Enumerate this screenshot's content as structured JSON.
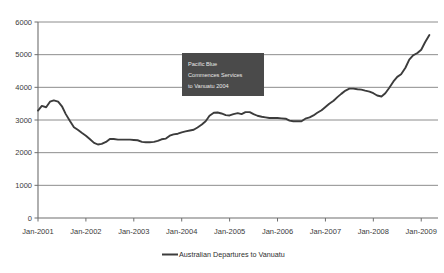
{
  "chart_data": {
    "type": "line",
    "title": "",
    "xlabel": "",
    "ylabel": "",
    "ylim": [
      0,
      6000
    ],
    "ytick_labels": [
      "0",
      "1000",
      "2000",
      "3000",
      "4000",
      "5000",
      "6000"
    ],
    "ytick_values": [
      0,
      1000,
      2000,
      3000,
      4000,
      5000,
      6000
    ],
    "xtick_labels": [
      "Jan-2001",
      "Jan-2002",
      "Jan-2003",
      "Jan-2004",
      "Jan-2005",
      "Jan-2006",
      "Jan-2007",
      "Jan-2008",
      "Jan-2009"
    ],
    "xtick_values": [
      2001,
      2002,
      2003,
      2004,
      2005,
      2006,
      2007,
      2008,
      2009
    ],
    "xlim": [
      2001,
      2009.35
    ],
    "grid": "horizontal",
    "legend_position": "bottom",
    "legend": [
      "Australian Departures to Vanuatu"
    ],
    "series": [
      {
        "name": "Australian Departures to Vanuatu",
        "color": "#3c3c3c",
        "x": [
          2001.0,
          2001.08,
          2001.17,
          2001.25,
          2001.33,
          2001.42,
          2001.5,
          2001.58,
          2001.67,
          2001.75,
          2001.83,
          2001.92,
          2002.0,
          2002.08,
          2002.17,
          2002.25,
          2002.33,
          2002.42,
          2002.5,
          2002.58,
          2002.67,
          2002.75,
          2002.83,
          2002.92,
          2003.0,
          2003.08,
          2003.17,
          2003.25,
          2003.33,
          2003.42,
          2003.5,
          2003.58,
          2003.67,
          2003.75,
          2003.83,
          2003.92,
          2004.0,
          2004.08,
          2004.17,
          2004.25,
          2004.33,
          2004.42,
          2004.5,
          2004.58,
          2004.67,
          2004.75,
          2004.83,
          2004.92,
          2005.0,
          2005.08,
          2005.17,
          2005.25,
          2005.33,
          2005.42,
          2005.5,
          2005.58,
          2005.67,
          2005.75,
          2005.83,
          2005.92,
          2006.0,
          2006.08,
          2006.17,
          2006.25,
          2006.33,
          2006.42,
          2006.5,
          2006.58,
          2006.67,
          2006.75,
          2006.83,
          2006.92,
          2007.0,
          2007.08,
          2007.17,
          2007.25,
          2007.33,
          2007.42,
          2007.5,
          2007.58,
          2007.67,
          2007.75,
          2007.83,
          2007.92,
          2008.0,
          2008.08,
          2008.17,
          2008.25,
          2008.33,
          2008.42,
          2008.5,
          2008.58,
          2008.67,
          2008.75,
          2008.83,
          2008.92,
          2009.0,
          2009.08,
          2009.17
        ],
        "values": [
          3290,
          3430,
          3390,
          3560,
          3600,
          3560,
          3420,
          3180,
          2960,
          2780,
          2700,
          2600,
          2520,
          2420,
          2300,
          2250,
          2270,
          2330,
          2420,
          2420,
          2400,
          2400,
          2400,
          2400,
          2390,
          2380,
          2330,
          2320,
          2320,
          2330,
          2360,
          2410,
          2430,
          2520,
          2560,
          2580,
          2620,
          2650,
          2680,
          2700,
          2770,
          2860,
          2960,
          3130,
          3220,
          3230,
          3200,
          3150,
          3140,
          3180,
          3210,
          3180,
          3240,
          3240,
          3180,
          3130,
          3100,
          3080,
          3060,
          3060,
          3060,
          3050,
          3040,
          2980,
          2960,
          2960,
          2960,
          3040,
          3080,
          3140,
          3220,
          3300,
          3400,
          3500,
          3590,
          3700,
          3800,
          3900,
          3960,
          3960,
          3940,
          3930,
          3900,
          3870,
          3820,
          3750,
          3720,
          3820,
          3980,
          4180,
          4320,
          4400,
          4600,
          4850,
          4980,
          5050,
          5150,
          5380,
          5600
        ]
      }
    ],
    "annotations": [
      {
        "id": "pacific-blue-note",
        "lines": [
          "Pacific Blue",
          "Commences Services",
          "to Vanuatu 2004"
        ],
        "box_color": "#4a4a4a",
        "text_color": "#e8e8e8"
      }
    ]
  }
}
